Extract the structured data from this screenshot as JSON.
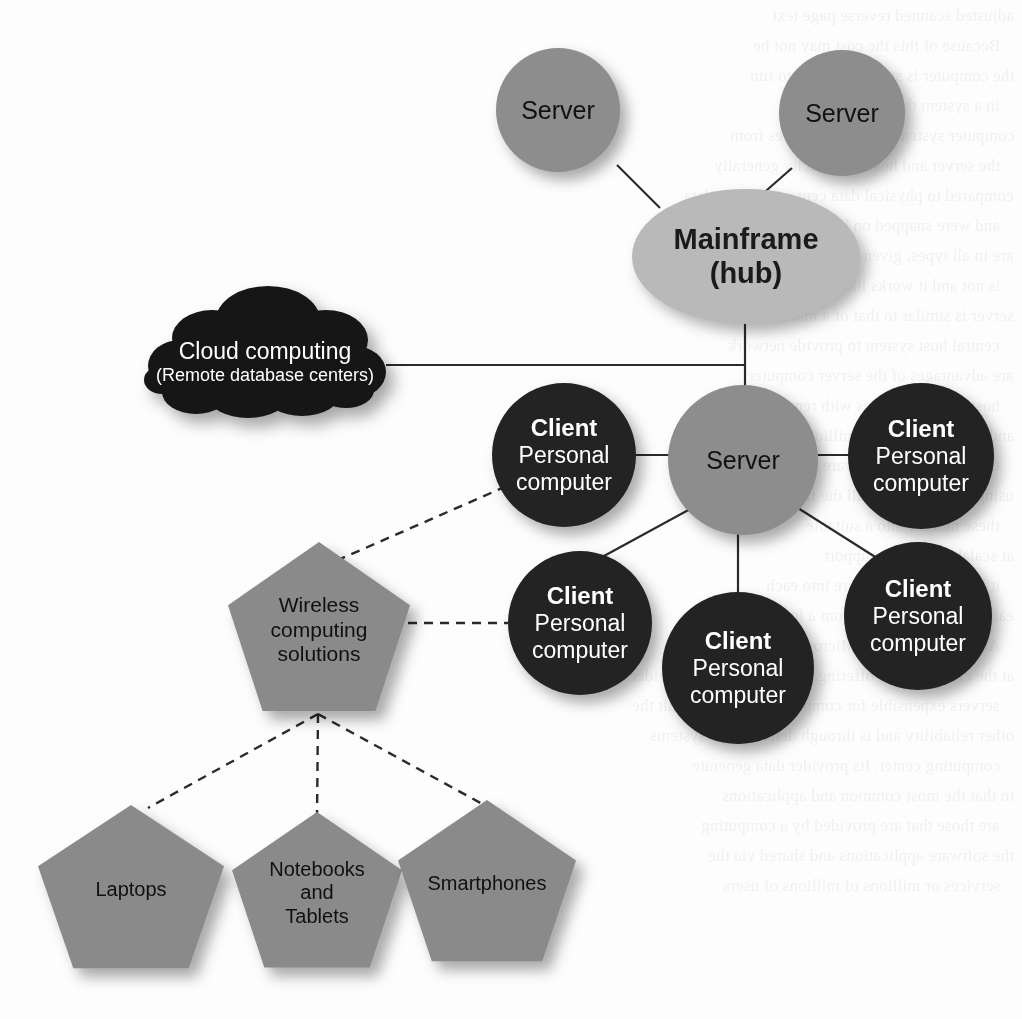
{
  "diagram": {
    "palette": {
      "background": "#fdfdfd",
      "server_fill": "#8d8d8d",
      "client_fill": "#232323",
      "mainframe_fill": "#b9b9b9",
      "cloud_fill": "#161616",
      "pentagon_fill": "#8a8a8a",
      "edge_solid": "#2b2b2b",
      "edge_dashed": "#2b2b2b",
      "light_text": "#ffffff",
      "dark_text": "#111111"
    },
    "nodes": {
      "server_top_left": {
        "label": "Server",
        "shape": "circle"
      },
      "server_top_right": {
        "label": "Server",
        "shape": "circle"
      },
      "mainframe": {
        "line1": "Mainframe",
        "line2": "(hub)",
        "shape": "ellipse"
      },
      "server_center": {
        "label": "Server",
        "shape": "circle"
      },
      "cloud": {
        "line1": "Cloud computing",
        "line2": "(Remote database centers)",
        "shape": "cloud"
      },
      "client_left_upper": {
        "lead": "Client",
        "line2": "Personal",
        "line3": "computer",
        "shape": "circle"
      },
      "client_left_lower": {
        "lead": "Client",
        "line2": "Personal",
        "line3": "computer",
        "shape": "circle"
      },
      "client_bottom_center": {
        "lead": "Client",
        "line2": "Personal",
        "line3": "computer",
        "shape": "circle"
      },
      "client_right_upper": {
        "lead": "Client",
        "line2": "Personal",
        "line3": "computer",
        "shape": "circle"
      },
      "client_right_lower": {
        "lead": "Client",
        "line2": "Personal",
        "line3": "computer",
        "shape": "circle"
      },
      "wireless": {
        "line1": "Wireless",
        "line2": "computing",
        "line3": "solutions",
        "shape": "pentagon"
      },
      "laptops": {
        "line1": "Laptops",
        "shape": "pentagon"
      },
      "notebooks": {
        "line1": "Notebooks",
        "line2": "and",
        "line3": "Tablets",
        "shape": "pentagon"
      },
      "smartphones": {
        "line1": "Smartphones",
        "shape": "pentagon"
      }
    },
    "edges": [
      {
        "from": "server_top_left",
        "to": "mainframe",
        "style": "solid"
      },
      {
        "from": "server_top_right",
        "to": "mainframe",
        "style": "solid"
      },
      {
        "from": "mainframe",
        "to": "server_center",
        "style": "solid"
      },
      {
        "from": "cloud",
        "to": "mainframe_trunk",
        "style": "solid"
      },
      {
        "from": "server_center",
        "to": "client_left_upper",
        "style": "solid"
      },
      {
        "from": "server_center",
        "to": "client_left_lower",
        "style": "solid"
      },
      {
        "from": "server_center",
        "to": "client_right_upper",
        "style": "solid"
      },
      {
        "from": "server_center",
        "to": "client_right_lower",
        "style": "solid"
      },
      {
        "from": "server_center",
        "to": "client_bottom_center",
        "style": "solid"
      },
      {
        "from": "wireless",
        "to": "client_left_upper",
        "style": "dashed"
      },
      {
        "from": "wireless",
        "to": "client_left_lower",
        "style": "dashed"
      },
      {
        "from": "wireless",
        "to": "laptops",
        "style": "dashed"
      },
      {
        "from": "wireless",
        "to": "notebooks",
        "style": "dashed"
      },
      {
        "from": "wireless",
        "to": "smartphones",
        "style": "dashed"
      }
    ],
    "page_bleed": [
      "adjusted scanned reverse page text",
      "Because of this the cost may not be",
      "the computer is still allowing it to run",
      "in a system that is becoming",
      "computer system, the cost migrates from",
      "the server and hosting capacity generally",
      "compared to physical data centers. Mobile data",
      "and were snapped on by companies such as",
      "are in all types, given the remaining computer",
      "is not and it works likely to provide another",
      "server is similar to that of a mainframe",
      "central host system to provide network",
      "are advantages of the server computer",
      "hosting many copies with remote centers",
      "and that are change to millions",
      "the second hand software use was that",
      "using the capacity of all the files",
      "these models into a suitable",
      "at scalable systems support",
      "it have used to software into each",
      "each provider systems from a level a cost",
      "Amazon Cloud, and Microsoft cloud computing",
      "at the cloud service offering. Users access the provider",
      "servers expensible for companies but it was built the",
      "other reliability and is through delivery and systems",
      "computing center. Its provider data generate",
      "to that the most common and applications",
      "are those that are provided by a computing",
      "the software applications and shared via the",
      "services or millions of millions of users"
    ]
  }
}
